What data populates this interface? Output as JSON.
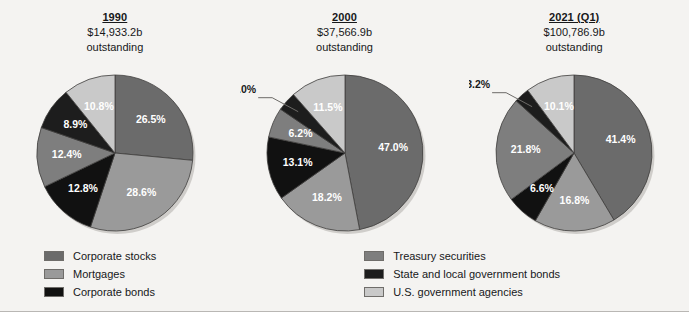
{
  "figure": {
    "background_color": "#f4f3f1"
  },
  "chart_data": {
    "type": "pie",
    "title": "",
    "subtitle": "",
    "xlabel": "",
    "ylabel": "",
    "legend_position": "bottom",
    "grid": false,
    "value_unit": "percent",
    "categories": [
      "Corporate stocks",
      "Mortgages",
      "Corporate bonds",
      "Treasury securities",
      "State and local government bonds",
      "U.S. government agencies"
    ],
    "category_colors": [
      "#6b6b6b",
      "#9a9a9a",
      "#111111",
      "#7e7e7e",
      "#1d1d1d",
      "#c9c9c9"
    ],
    "charts": [
      {
        "id": "pie-1990",
        "year": "1990",
        "amount": "$14,933.2b",
        "sub": "outstanding",
        "values": [
          26.5,
          28.6,
          12.8,
          12.4,
          8.9,
          10.8
        ],
        "labels": [
          "26.5%",
          "28.6%",
          "12.8%",
          "12.4%",
          "8.9%",
          "10.8%"
        ],
        "callout_index": -1
      },
      {
        "id": "pie-2000",
        "year": "2000",
        "amount": "$37,566.9b",
        "sub": "outstanding",
        "values": [
          47.0,
          18.2,
          13.1,
          6.2,
          4.0,
          11.5
        ],
        "labels": [
          "47.0%",
          "18.2%",
          "13.1%",
          "6.2%",
          "4.0%",
          "11.5%"
        ],
        "callout_index": 4
      },
      {
        "id": "pie-2021q1",
        "year": "2021 (Q1)",
        "amount": "$100,786.9b",
        "sub": "outstanding",
        "values": [
          41.4,
          16.8,
          6.6,
          21.8,
          3.2,
          10.1
        ],
        "labels": [
          "41.4%",
          "16.8%",
          "6.6%",
          "21.8%",
          "3.2%",
          "10.1%"
        ],
        "callout_index": 4
      }
    ]
  },
  "legend": {
    "left_column": [
      {
        "label": "Corporate stocks",
        "color": "#6b6b6b"
      },
      {
        "label": "Mortgages",
        "color": "#9a9a9a"
      },
      {
        "label": "Corporate bonds",
        "color": "#111111"
      }
    ],
    "right_column": [
      {
        "label": "Treasury securities",
        "color": "#7e7e7e"
      },
      {
        "label": "State and local government bonds",
        "color": "#1d1d1d"
      },
      {
        "label": "U.S. government agencies",
        "color": "#c9c9c9"
      }
    ]
  }
}
